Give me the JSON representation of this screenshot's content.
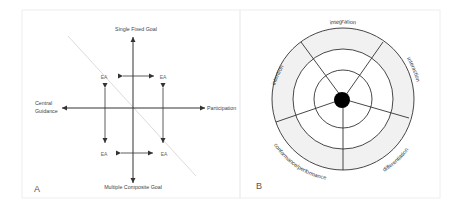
{
  "panel_a": {
    "label": "A",
    "axes": {
      "top": "Single Fixed Goal",
      "bottom": "Multiple Composite Goal",
      "left_line1": "Central",
      "left_line2": "Guidance",
      "right": "Participation"
    },
    "quadrant_labels": [
      "EA",
      "EA",
      "EA",
      "EA"
    ]
  },
  "panel_b": {
    "label": "B",
    "segments": {
      "top": "integration",
      "right": "interaction",
      "left": "intention",
      "bottom_left": "conformance/performance",
      "bottom_right": "differentiation"
    }
  },
  "colors": {
    "line": "#333333",
    "diagonal": "#d8d8d8",
    "ring_fill": "#f1f1f1",
    "text": "#444444",
    "frame": "#eeeeee"
  }
}
